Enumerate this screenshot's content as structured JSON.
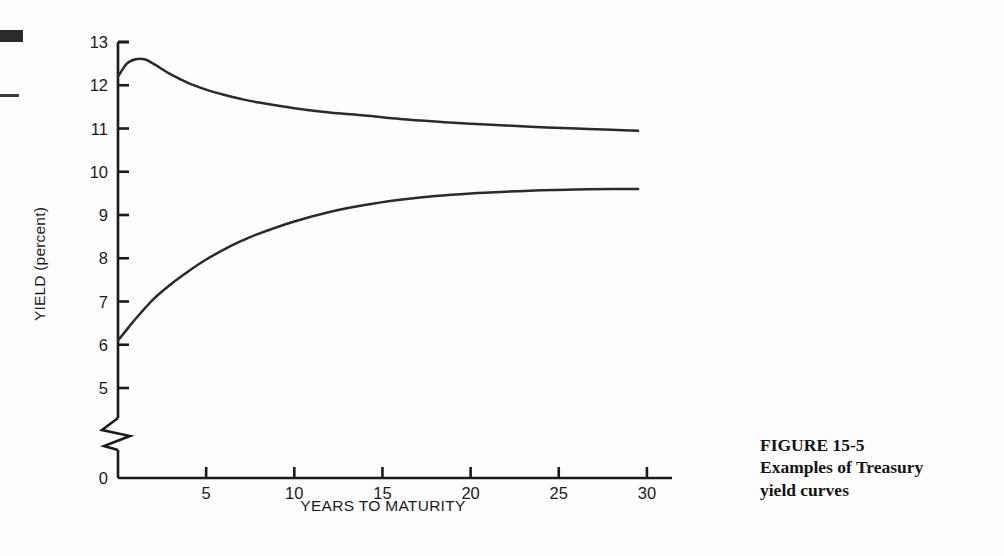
{
  "figure": {
    "caption_number": "FIGURE 15-5",
    "caption_line_1": "Examples of Treasury",
    "caption_line_2": "yield curves"
  },
  "axes": {
    "y_title": "YIELD (percent)",
    "x_title": "YEARS TO MATURITY",
    "y_tick_labels": [
      "13",
      "12",
      "11",
      "10",
      "9",
      "8",
      "7",
      "6",
      "5",
      "0"
    ],
    "x_tick_labels": [
      "0",
      "5",
      "10",
      "15",
      "20",
      "25",
      "30"
    ],
    "axis_break": "zigzag-break"
  },
  "colors": {
    "ink": "#1a1a1a",
    "curve": "#2a2a2a",
    "background": "#fdfdfd"
  },
  "chart_data": {
    "type": "line",
    "title": "Examples of Treasury yield curves",
    "xlabel": "YEARS TO MATURITY",
    "ylabel": "YIELD (percent)",
    "xlim": [
      0,
      30
    ],
    "ylim": [
      5,
      13
    ],
    "y_axis_break": true,
    "y_break_below": 5,
    "y_baseline_label": "0",
    "xticks": [
      0,
      5,
      10,
      15,
      20,
      25,
      30
    ],
    "yticks": [
      5,
      6,
      7,
      8,
      9,
      10,
      11,
      12,
      13
    ],
    "grid": false,
    "legend": "none",
    "series": [
      {
        "name": "Inverted (descending) yield curve",
        "x": [
          0,
          0.5,
          1.0,
          1.5,
          2,
          3,
          4,
          5,
          6,
          7,
          8,
          10,
          12,
          14,
          16,
          18,
          20,
          22,
          24,
          26,
          28,
          29.5
        ],
        "values": [
          12.2,
          12.5,
          12.6,
          12.6,
          12.5,
          12.25,
          12.05,
          11.9,
          11.78,
          11.68,
          11.6,
          11.47,
          11.37,
          11.3,
          11.22,
          11.16,
          11.11,
          11.07,
          11.03,
          11.0,
          10.97,
          10.95
        ]
      },
      {
        "name": "Normal (ascending) yield curve",
        "x": [
          0,
          0.5,
          1,
          2,
          3,
          4,
          5,
          6,
          7,
          8,
          10,
          12,
          14,
          16,
          18,
          20,
          22,
          24,
          26,
          28,
          29.5
        ],
        "values": [
          6.1,
          6.35,
          6.6,
          7.05,
          7.4,
          7.7,
          7.97,
          8.2,
          8.4,
          8.57,
          8.85,
          9.07,
          9.23,
          9.35,
          9.44,
          9.5,
          9.54,
          9.57,
          9.59,
          9.6,
          9.6
        ]
      }
    ]
  }
}
